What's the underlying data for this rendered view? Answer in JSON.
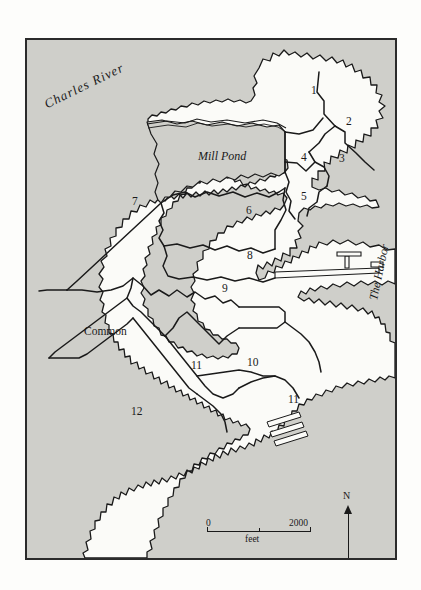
{
  "map": {
    "title_visible": false,
    "frame": {
      "x": 25,
      "y": 38,
      "width": 372,
      "height": 522
    },
    "colors": {
      "water_fill": "#cfcfca",
      "land_fill": "#fbfbf8",
      "outline": "#1a1a1a",
      "frame": "#2b2b2b",
      "page": "#fdfdfb"
    },
    "water_labels": [
      {
        "id": "charles-river",
        "text": "Charles River",
        "style": "italic",
        "rotation_deg": -26,
        "x": 43,
        "y": 96
      },
      {
        "id": "mill-pond",
        "text": "Mill Pond",
        "style": "italic",
        "rotation_deg": 0,
        "x": 196,
        "y": 148
      },
      {
        "id": "the-harbor",
        "text": "The Harbor",
        "style": "italic",
        "rotation_deg": -78,
        "x": 371,
        "y": 292
      }
    ],
    "place_labels": [
      {
        "id": "common",
        "text": "Common",
        "x": 82,
        "y": 328
      }
    ],
    "ward_labels": [
      {
        "ward": "1",
        "x": 309,
        "y": 87
      },
      {
        "ward": "2",
        "x": 344,
        "y": 118
      },
      {
        "ward": "3",
        "x": 337,
        "y": 155
      },
      {
        "ward": "4",
        "x": 299,
        "y": 154
      },
      {
        "ward": "5",
        "x": 299,
        "y": 193
      },
      {
        "ward": "6",
        "x": 244,
        "y": 207
      },
      {
        "ward": "7",
        "x": 130,
        "y": 198
      },
      {
        "ward": "8",
        "x": 245,
        "y": 252
      },
      {
        "ward": "9",
        "x": 220,
        "y": 285
      },
      {
        "ward": "10",
        "x": 248,
        "y": 359
      },
      {
        "ward": "11",
        "x": 192,
        "y": 362
      },
      {
        "ward": "11",
        "x": 289,
        "y": 396
      },
      {
        "ward": "12",
        "x": 132,
        "y": 408
      }
    ],
    "scale_bar": {
      "min_label": "0",
      "max_label": "2000",
      "units_label": "feet",
      "length_px": 104
    },
    "north_arrow": {
      "label": "N"
    },
    "signature": {
      "text": "rtr"
    }
  }
}
